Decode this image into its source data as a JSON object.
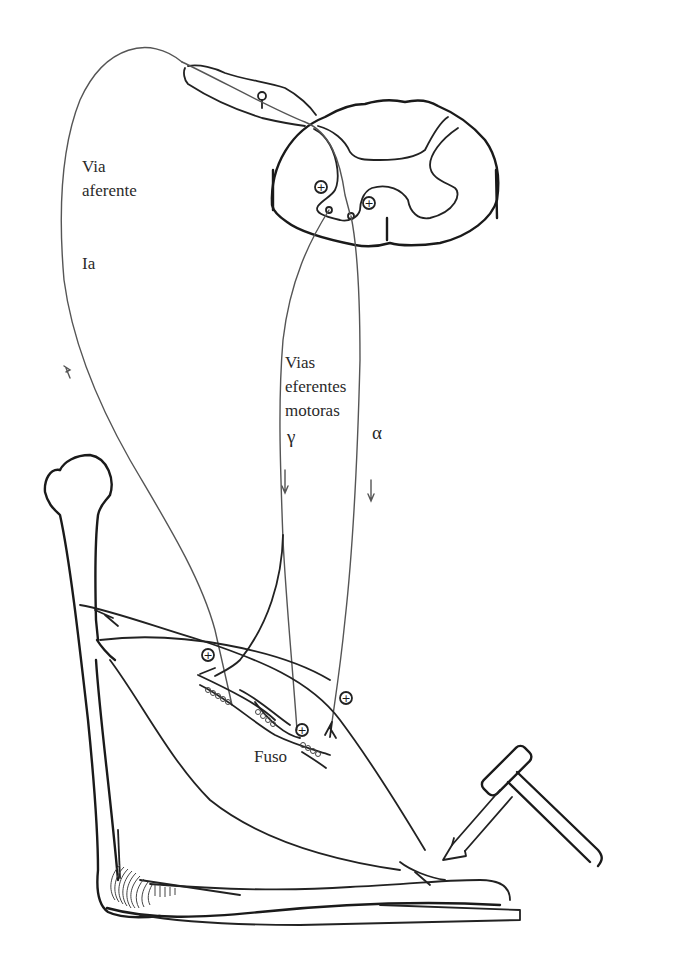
{
  "diagram": {
    "labels": {
      "afferent_line1": "Via",
      "afferent_line2": "aferente",
      "afferent_fiber": "Ia",
      "efferent_line1": "Vias",
      "efferent_line2": "eferentes",
      "efferent_line3": "motoras",
      "gamma": "γ",
      "alpha": "α",
      "spindle": "Fuso"
    },
    "symbols": {
      "excitatory_synapse": "⊕",
      "arrow_down": "↓",
      "arrow_up": "↑"
    },
    "structures": [
      "spinal-cord-cross-section",
      "dorsal-root-ganglion",
      "afferent-fiber-Ia",
      "gamma-motor-fiber",
      "alpha-motor-fiber",
      "femur",
      "quadriceps-muscle",
      "muscle-spindle",
      "patellar-tendon",
      "tibia",
      "reflex-hammer",
      "stimulus-arrow"
    ],
    "colors": {
      "stroke": "#1a1a1a",
      "background": "#ffffff",
      "text": "#2a2a2a"
    }
  }
}
